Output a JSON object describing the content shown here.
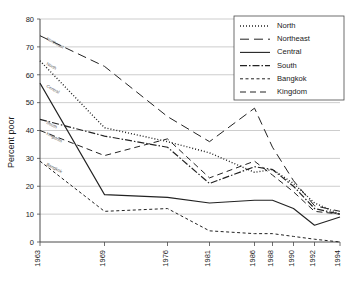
{
  "chart_data": {
    "type": "line",
    "title": "",
    "xlabel": "",
    "ylabel": "Percent poor",
    "ylim": [
      0,
      80
    ],
    "ytick_step": 10,
    "grid": true,
    "legend_position": "top-right",
    "categories": [
      "1963",
      "1969",
      "1976",
      "1981",
      "1986",
      "1988",
      "1990",
      "1992",
      "1994"
    ],
    "yticks": [
      "0",
      "10",
      "20",
      "30",
      "40",
      "50",
      "60",
      "70",
      "80"
    ],
    "series": [
      {
        "name": "North",
        "style": "dotted",
        "inline_label": "North",
        "values": [
          65,
          41,
          36,
          32,
          25,
          26,
          21,
          14,
          10
        ]
      },
      {
        "name": "Northeast",
        "style": "long-dash",
        "inline_label": "Northeast",
        "values": [
          74,
          63,
          45,
          36,
          48,
          34,
          22,
          13,
          11
        ]
      },
      {
        "name": "Central",
        "style": "solid",
        "inline_label": "Central",
        "values": [
          57,
          17,
          16,
          14,
          15,
          15,
          12,
          6,
          9
        ]
      },
      {
        "name": "South",
        "style": "dash-dot",
        "inline_label": "South",
        "values": [
          44,
          38,
          34,
          21,
          27,
          26,
          20,
          12,
          10
        ]
      },
      {
        "name": "Bangkok",
        "style": "short-dash",
        "inline_label": "Bangkok",
        "values": [
          29,
          11,
          12,
          4,
          3,
          3,
          2,
          1,
          0
        ]
      },
      {
        "name": "Kingdom",
        "style": "medium-dash",
        "inline_label": "Kingdom",
        "values": [
          40,
          31,
          37,
          23,
          29,
          24,
          18,
          11,
          10
        ]
      }
    ]
  },
  "axes": {
    "y_axis_title": "Percent poor"
  },
  "legend": {
    "items": [
      {
        "label": "North"
      },
      {
        "label": "Northeast"
      },
      {
        "label": "Central"
      },
      {
        "label": "South"
      },
      {
        "label": "Bangkok"
      },
      {
        "label": "Kingdom"
      }
    ]
  }
}
